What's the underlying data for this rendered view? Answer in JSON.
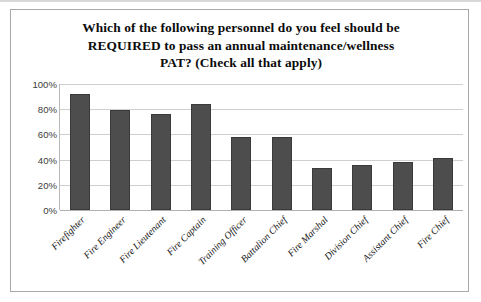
{
  "chart_data": {
    "type": "bar",
    "title": "Which of the following personnel do you feel should be REQUIRED to pass an annual maintenance/wellness PAT? (Check all that apply)",
    "title_lines": [
      "Which of the following personnel do you feel should be",
      "REQUIRED to pass an annual maintenance/wellness",
      "PAT? (Check all that apply)"
    ],
    "categories": [
      "Firefighter",
      "Fire Engineer",
      "Fire Lieutenant",
      "Fire Captain",
      "Training Officer",
      "Battalion Chief",
      "Fire Marshal",
      "Division Chief",
      "Assistant Chief",
      "Fire Chief"
    ],
    "values": [
      92,
      79,
      76,
      84,
      58,
      58,
      33,
      36,
      38,
      41
    ],
    "value_unit": "%",
    "xlabel": "",
    "ylabel": "",
    "ylim": [
      0,
      100
    ],
    "y_ticks": [
      100,
      80,
      60,
      40,
      20,
      0
    ],
    "y_tick_labels": [
      "100%",
      "80%",
      "60%",
      "40%",
      "20%",
      "0%"
    ],
    "grid": true,
    "legend": false,
    "series_color": "#4d4d4d",
    "gridline_color": "#cfcfcf",
    "axis_color": "#b9b9b9",
    "background": "#ffffff"
  }
}
